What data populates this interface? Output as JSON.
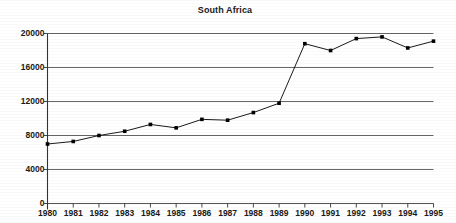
{
  "chart_data": {
    "type": "line",
    "title": "South Africa",
    "xlabel": "",
    "ylabel": "",
    "categories": [
      "1980",
      "1981",
      "1982",
      "1983",
      "1984",
      "1985",
      "1986",
      "1987",
      "1988",
      "1989",
      "1990",
      "1991",
      "1992",
      "1993",
      "1994",
      "1995"
    ],
    "values": [
      7000,
      7300,
      8000,
      8500,
      9300,
      8900,
      9900,
      9800,
      10700,
      11800,
      18800,
      18000,
      19400,
      19600,
      18300,
      19100
    ],
    "ylim": [
      0,
      20000
    ],
    "yticks": [
      0,
      4000,
      8000,
      12000,
      16000,
      20000
    ],
    "ytick_labels": [
      "0",
      "4000",
      "8000",
      "12000",
      "16000",
      "20000"
    ],
    "xtick_labels": [
      "1980",
      "1981",
      "1982",
      "1983",
      "1984",
      "1985",
      "1986",
      "1987",
      "1988",
      "1989",
      "1990",
      "1991",
      "1992",
      "1993",
      "1994",
      "1995"
    ],
    "grid": true,
    "legend": null,
    "marker": "square",
    "line_color": "#000000",
    "marker_color": "#000000",
    "grid_color": "#555555",
    "axis_color": "#333333",
    "background": "#ffffff"
  }
}
